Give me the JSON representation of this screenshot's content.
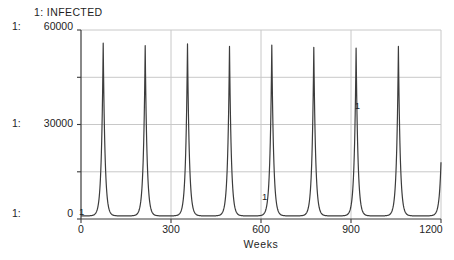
{
  "figure_title": "1: INFECTED",
  "y_axis": {
    "labels": [
      {
        "prefix": "1:",
        "value": "60000"
      },
      {
        "prefix": "1:",
        "value": "30000"
      },
      {
        "prefix": "1:",
        "value": "0"
      }
    ]
  },
  "x_axis_title": "Weeks",
  "chart_data": {
    "type": "line",
    "title": "1: INFECTED",
    "series_number": "1",
    "series_name": "INFECTED",
    "xlabel": "Weeks",
    "ylabel": "",
    "xlim": [
      0,
      1200
    ],
    "ylim": [
      0,
      60000
    ],
    "x_ticks": [
      0,
      300,
      600,
      900,
      1200
    ],
    "y_tick_values": [
      0,
      15000,
      30000,
      45000,
      60000
    ],
    "y_labeled_ticks": [
      0,
      30000,
      60000
    ],
    "x_gridlines": [
      300,
      600,
      900,
      1200
    ],
    "y_gridlines": [
      15000,
      30000,
      45000,
      60000
    ],
    "grid": "on",
    "baseline_value": 1000,
    "peak_weeks": [
      74,
      214,
      355,
      495,
      636,
      776,
      917,
      1058
    ],
    "peak_values": [
      55800,
      55000,
      55600,
      54800,
      55200,
      54500,
      54300,
      54800
    ],
    "pulse_tau_weeks": 6,
    "curve_end": {
      "week": 1200,
      "value": 18000,
      "trend": "rising"
    },
    "curve_marker_label": "1",
    "curve_markers": [
      {
        "week": 2,
        "value": 2500
      },
      {
        "week": 612,
        "value": 7300
      },
      {
        "week": 921,
        "value": 36000
      }
    ],
    "colors": {
      "curve": "#3c3c3c",
      "grid": "#c8c8c8",
      "axis": "#3a3a3a",
      "text": "#1e1e1e",
      "background": "#ffffff"
    }
  }
}
